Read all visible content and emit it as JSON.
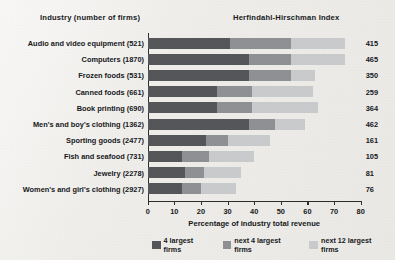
{
  "headers": {
    "industry": "Industry (number of firms)",
    "hhi": "Herfindahl-Hirschman Index"
  },
  "chart_data": {
    "type": "bar",
    "orientation": "horizontal",
    "stacked": true,
    "title": "",
    "xlabel": "Percentage of industry total revenue",
    "ylabel": "Industry (number of firms)",
    "xlim": [
      0,
      80
    ],
    "xticks": [
      0,
      10,
      20,
      30,
      40,
      50,
      60,
      70,
      80
    ],
    "xtick_labels": [
      "0",
      "10",
      "20",
      "30",
      "40",
      "50",
      "60",
      "70",
      "80"
    ],
    "grid": false,
    "legend_position": "bottom",
    "categories": [
      "Audio and video equipment  (521)",
      "Computers  (1870)",
      "Frozen foods  (531)",
      "Canned foods  (661)",
      "Book printing  (690)",
      "Men's and boy's clothing  (1362)",
      "Sporting goods  (2477)",
      "Fish and seafood  (731)",
      "Jewelry  (2278)",
      "Women's and girl's clothing  (2927)"
    ],
    "series": [
      {
        "name": "4 largest firms",
        "color": "#55565a",
        "values": [
          31,
          38,
          38,
          26,
          26,
          38,
          22,
          13,
          14,
          13
        ]
      },
      {
        "name": "next 4 largest firms",
        "color": "#8e9094",
        "values": [
          23,
          16,
          16,
          13,
          13,
          10,
          8,
          10,
          7,
          7
        ]
      },
      {
        "name": "next 12 largest firms",
        "color": "#c9cacb",
        "values": [
          20,
          20,
          9,
          23,
          25,
          11,
          16,
          17,
          14,
          13
        ]
      }
    ],
    "value_labels": {
      "name": "Herfindahl-Hirschman Index",
      "values": [
        415,
        465,
        350,
        259,
        364,
        462,
        161,
        105,
        81,
        76
      ]
    }
  },
  "legend": [
    {
      "label": "4 largest firms",
      "color": "#55565a"
    },
    {
      "label": "next 4 largest firms",
      "color": "#8e9094"
    },
    {
      "label": "next 12 largest firms",
      "color": "#c9cacb"
    }
  ]
}
